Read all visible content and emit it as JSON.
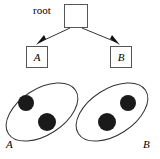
{
  "figure": {
    "title": "root",
    "width": 160,
    "height": 159,
    "background_color": "#ffffff",
    "stroke_color": "#333333",
    "dot_color": "#1a1a1a"
  },
  "tree": {
    "root": {
      "label": "root",
      "box": {
        "x": 64,
        "y": 4,
        "width": 24,
        "height": 24
      }
    },
    "children": [
      {
        "label": "A",
        "box": {
          "x": 26,
          "y": 46,
          "width": 22,
          "height": 22
        }
      },
      {
        "label": "B",
        "box": {
          "x": 110,
          "y": 46,
          "width": 22,
          "height": 22
        }
      }
    ],
    "edges": [
      {
        "from": "root",
        "to": "A",
        "arrow": "arrow-head-left"
      },
      {
        "from": "root",
        "to": "B",
        "arrow": "arrow-head-right"
      }
    ]
  },
  "clusters": [
    {
      "label": "A",
      "ellipse": {
        "cx": 42,
        "cy": 112,
        "rx": 40,
        "ry": 23,
        "rotation": -33
      },
      "points": [
        {
          "cx": 26,
          "cy": 103,
          "r": 8
        },
        {
          "cx": 47,
          "cy": 122,
          "r": 9
        }
      ],
      "label_position": {
        "x": 6,
        "y": 148
      }
    },
    {
      "label": "B",
      "ellipse": {
        "cx": 112,
        "cy": 112,
        "rx": 40,
        "ry": 23,
        "rotation": -33
      },
      "points": [
        {
          "cx": 128,
          "cy": 103,
          "r": 8
        },
        {
          "cx": 107,
          "cy": 122,
          "r": 9
        }
      ],
      "label_position": {
        "x": 143,
        "y": 148
      }
    }
  ]
}
